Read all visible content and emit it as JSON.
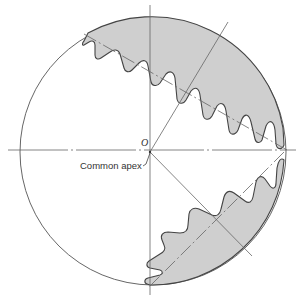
{
  "diagram": {
    "labels": {
      "apex_point": "O",
      "apex_caption": "Common apex"
    },
    "colors": {
      "gear_fill": "#cfcfcf",
      "outline": "#555555",
      "axis_line": "#777777",
      "background": "#ffffff"
    },
    "elements": [
      "sphere-outline",
      "horizontal-axis",
      "vertical-axis",
      "upper-gear-teeth",
      "lower-gear-teeth",
      "upper-gear-axis",
      "lower-gear-axis",
      "upper-pitch-line",
      "lower-pitch-line"
    ]
  }
}
